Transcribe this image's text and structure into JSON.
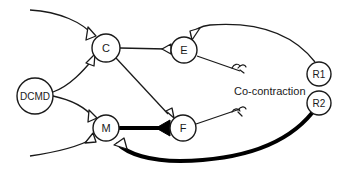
{
  "diagram": {
    "type": "neural-circuit",
    "nodes": [
      {
        "id": "C",
        "label": "C"
      },
      {
        "id": "E",
        "label": "E"
      },
      {
        "id": "DCMD",
        "label": "DCMD"
      },
      {
        "id": "M",
        "label": "M"
      },
      {
        "id": "F",
        "label": "F"
      },
      {
        "id": "R1",
        "label": "R1"
      },
      {
        "id": "R2",
        "label": "R2"
      }
    ],
    "edges": [
      {
        "from": "input-top",
        "to": "C",
        "synapse": "excitatory-open"
      },
      {
        "from": "DCMD",
        "to": "C",
        "synapse": "excitatory-open"
      },
      {
        "from": "DCMD",
        "to": "M",
        "synapse": "excitatory-open"
      },
      {
        "from": "input-bottom",
        "to": "M",
        "synapse": "excitatory-open"
      },
      {
        "from": "C",
        "to": "E",
        "synapse": "excitatory-open"
      },
      {
        "from": "C",
        "to": "F",
        "synapse": "excitatory-open"
      },
      {
        "from": "M",
        "to": "F",
        "synapse": "strong-filled",
        "weight": "thick"
      },
      {
        "from": "R1",
        "to": "E",
        "synapse": "excitatory-open"
      },
      {
        "from": "R2",
        "to": "M",
        "synapse": "excitatory-open",
        "weight": "thick"
      },
      {
        "from": "E",
        "to": "muscle-ending",
        "synapse": "motor-ending"
      },
      {
        "from": "F",
        "to": "muscle-ending",
        "synapse": "motor-ending"
      }
    ],
    "annotation": "Co-contraction",
    "colors": {
      "line": "#1a1a1a",
      "background": "#ffffff"
    }
  }
}
